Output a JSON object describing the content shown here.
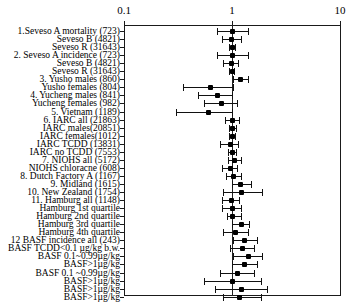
{
  "chart_data": {
    "type": "forest",
    "title": "",
    "xlabel": "",
    "ylabel": "",
    "xscale": "log",
    "xlim": [
      0.1,
      10
    ],
    "ticks": [
      {
        "value": 0.1,
        "label": "0.1"
      },
      {
        "value": 1,
        "label": "1"
      },
      {
        "value": 10,
        "label": "10"
      }
    ],
    "reference_line": 1,
    "grid": false,
    "legend": "none",
    "effect_measure": "Relative risk",
    "rows": [
      {
        "label": "1.Seveso A mortality (723)",
        "estimate": 1.0,
        "low": 0.72,
        "high": 1.42
      },
      {
        "label": "Seveso B (4821)",
        "estimate": 0.98,
        "low": 0.81,
        "high": 1.2
      },
      {
        "label": "Seveso R (31643)",
        "estimate": 0.99,
        "low": 0.93,
        "high": 1.06
      },
      {
        "label": "2. Seveso A incidence (723)",
        "estimate": 1.0,
        "low": 0.72,
        "high": 1.4
      },
      {
        "label": "Seveso B (4821)",
        "estimate": 0.97,
        "low": 0.83,
        "high": 1.14
      },
      {
        "label": "Seveso R (31643)",
        "estimate": 0.99,
        "low": 0.94,
        "high": 1.05
      },
      {
        "label": "3. Yusho males (860)",
        "estimate": 1.18,
        "low": 1.02,
        "high": 1.42
      },
      {
        "label": "Yusho females (804)",
        "estimate": 0.62,
        "low": 0.35,
        "high": 1.02
      },
      {
        "label": "4. Yucheng males (841)",
        "estimate": 0.72,
        "low": 0.48,
        "high": 1.0
      },
      {
        "label": "Yucheng females (982)",
        "estimate": 0.79,
        "low": 0.55,
        "high": 1.12
      },
      {
        "label": "5. Vietnam (1189)",
        "estimate": 0.6,
        "low": 0.3,
        "high": 1.0
      },
      {
        "label": "6. IARC all (21863)",
        "estimate": 1.0,
        "low": 0.87,
        "high": 1.15
      },
      {
        "label": "IARC males(20851)",
        "estimate": 1.0,
        "low": 0.94,
        "high": 1.08
      },
      {
        "label": "IARC females(1012)",
        "estimate": 0.99,
        "low": 0.93,
        "high": 1.06
      },
      {
        "label": "IARC TCDD (13831)",
        "estimate": 0.95,
        "low": 0.78,
        "high": 1.14
      },
      {
        "label": "IARC no TCDD (7553)",
        "estimate": 0.99,
        "low": 0.92,
        "high": 1.08
      },
      {
        "label": "7. NIOHS all (5172)",
        "estimate": 1.05,
        "low": 0.92,
        "high": 1.2
      },
      {
        "label": "NIOHS chloracne (608)",
        "estimate": 0.95,
        "low": 0.8,
        "high": 1.12
      },
      {
        "label": "8. Dutch Factory A (1167)",
        "estimate": 1.03,
        "low": 0.88,
        "high": 1.2
      },
      {
        "label": "9. Midland (1615)",
        "estimate": 1.18,
        "low": 1.0,
        "high": 1.5
      },
      {
        "label": "10. New Zealand (1754)",
        "estimate": 1.22,
        "low": 0.82,
        "high": 1.9
      },
      {
        "label": "11. Hamburg all (1148)",
        "estimate": 0.97,
        "low": 0.8,
        "high": 1.15
      },
      {
        "label": "Hamburg 1st quartile",
        "estimate": 1.0,
        "low": 0.8,
        "high": 1.2
      },
      {
        "label": "Hamburg 2nd quartile",
        "estimate": 1.0,
        "low": 0.9,
        "high": 1.2
      },
      {
        "label": "Hamburg 3rd quartile",
        "estimate": 1.2,
        "low": 1.0,
        "high": 1.45
      },
      {
        "label": "Hamburg 4th quartile",
        "estimate": 1.07,
        "low": 0.82,
        "high": 1.4
      },
      {
        "label": "12 BASF incidence all (243)",
        "estimate": 1.3,
        "low": 1.02,
        "high": 1.72
      },
      {
        "label": "BASF TCDD<0.1 µg/kg b.w.",
        "estimate": 1.25,
        "low": 0.95,
        "high": 1.6
      },
      {
        "label": "BASF 0.1~0.99µg/kg",
        "estimate": 1.4,
        "low": 1.02,
        "high": 1.9
      },
      {
        "label": "BASF>1µg/kg",
        "estimate": 1.3,
        "low": 1.0,
        "high": 1.72
      },
      {
        "label": "BASF 0.1 ~0.99µg/kg",
        "estimate": 1.12,
        "low": 0.78,
        "high": 1.6
      },
      {
        "label": "BASF>1µg/kg",
        "estimate": 1.0,
        "low": 0.55,
        "high": 1.85
      },
      {
        "label": "BASF>1µg/kg",
        "estimate": 1.2,
        "low": 0.7,
        "high": 2.1
      },
      {
        "label": "BASF>1µg/kg",
        "estimate": 1.15,
        "low": 0.82,
        "high": 1.85
      }
    ]
  },
  "axis": {
    "tick_low_label": "0.1",
    "tick_mid_label": "1",
    "tick_high_label": "10"
  },
  "colors": {
    "marker": "#000000",
    "line": "#111111",
    "axis": "#1a1a1a",
    "background": "#ffffff"
  }
}
